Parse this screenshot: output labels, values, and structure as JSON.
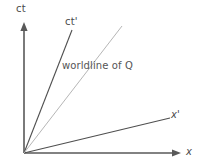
{
  "figure": {
    "kind": "minkowski-spacetime-diagram",
    "width": 200,
    "height": 167,
    "background": "#ffffff"
  },
  "labels": {
    "ct": "ct",
    "ct_prime": "ct'",
    "x": "x",
    "x_prime": "x'",
    "worldline": "worldline of Q"
  },
  "colors": {
    "axis": "#595959",
    "primed_axis": "#4f4f4f",
    "worldline": "#b6b6b6",
    "text": "#4a4a4a",
    "annotation_text": "#555555",
    "background": "#ffffff"
  },
  "chart_data": {
    "type": "line",
    "title": "",
    "xlabel": "x",
    "ylabel": "ct",
    "grid": false,
    "legend": "none",
    "origin": [
      24,
      153
    ],
    "xlim": [
      0,
      200
    ],
    "ylim": [
      0,
      167
    ],
    "series": [
      {
        "name": "ct",
        "label": "ct",
        "role": "axis",
        "color": "#595959",
        "width": 1.6,
        "arrow": "end",
        "points": [
          [
            24,
            153
          ],
          [
            24,
            22
          ]
        ]
      },
      {
        "name": "x",
        "label": "x",
        "role": "axis",
        "color": "#595959",
        "width": 1.6,
        "arrow": "end",
        "points": [
          [
            24,
            153
          ],
          [
            181,
            153
          ]
        ]
      },
      {
        "name": "ct_prime",
        "label": "ct'",
        "role": "primed-axis",
        "color": "#4f4f4f",
        "width": 1.1,
        "arrow": "none",
        "points": [
          [
            24,
            153
          ],
          [
            72,
            30
          ]
        ]
      },
      {
        "name": "x_prime",
        "label": "x'",
        "role": "primed-axis",
        "color": "#4f4f4f",
        "width": 1.1,
        "arrow": "none",
        "points": [
          [
            24,
            153
          ],
          [
            170,
            118
          ]
        ]
      },
      {
        "name": "worldline_q",
        "label": "worldline of Q",
        "role": "worldline",
        "color": "#b6b6b6",
        "width": 1.0,
        "arrow": "none",
        "points": [
          [
            24,
            153
          ],
          [
            122,
            26
          ]
        ]
      }
    ]
  }
}
